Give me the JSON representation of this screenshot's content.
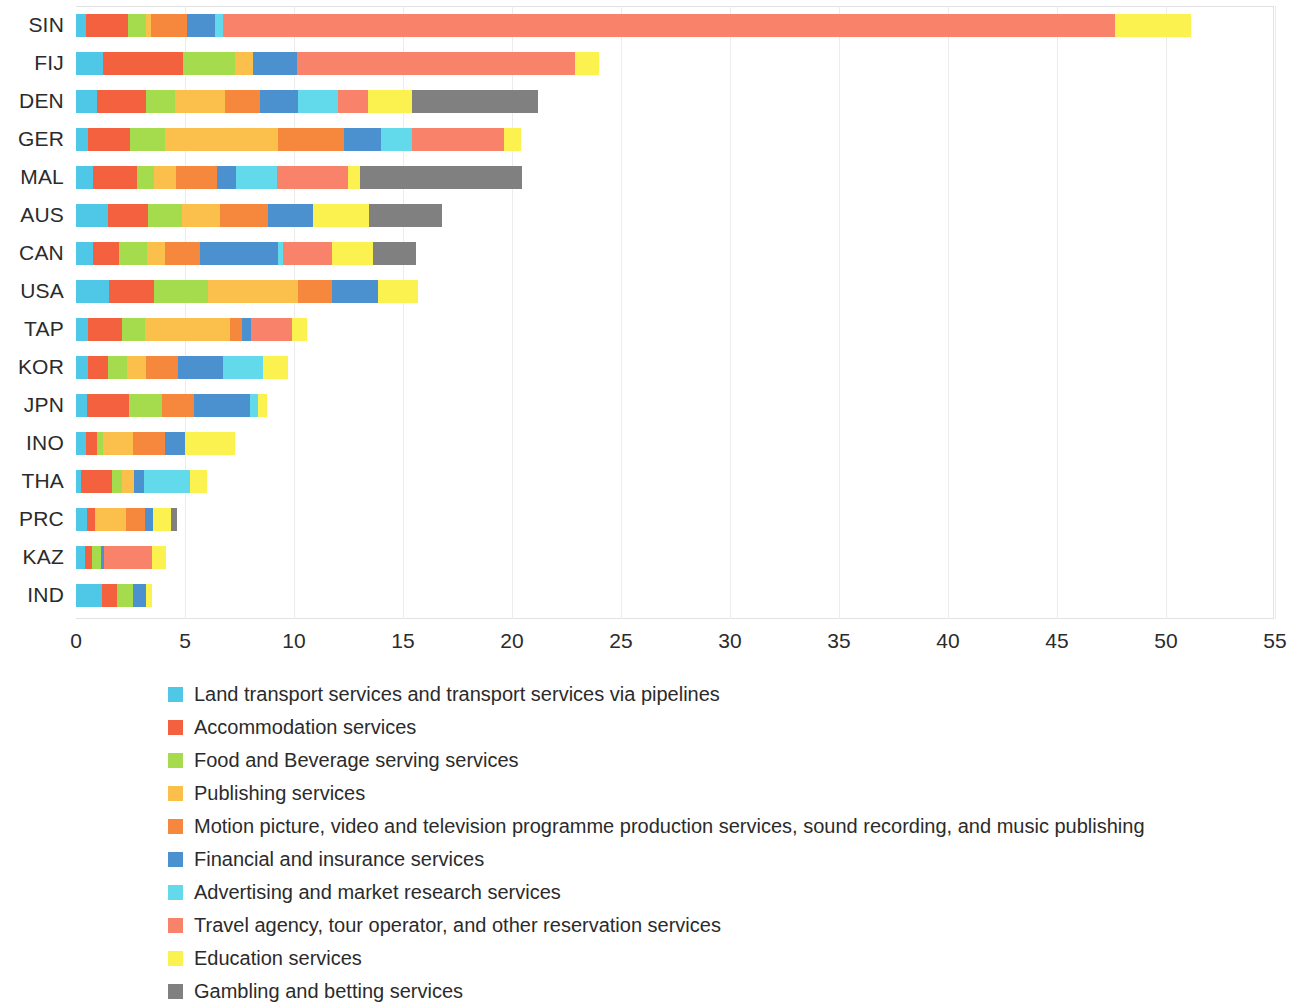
{
  "chart_data": {
    "type": "bar",
    "subtype": "horizontal-stacked",
    "title": "",
    "subtitle": "",
    "xlabel": "",
    "ylabel": "",
    "xlim": [
      0,
      55
    ],
    "ylim": null,
    "grid": true,
    "legend_position": "bottom-left",
    "x_ticks": [
      "0",
      "5",
      "10",
      "15",
      "20",
      "25",
      "30",
      "35",
      "40",
      "45",
      "50",
      "55"
    ],
    "x_tick_values": [
      0,
      5,
      10,
      15,
      20,
      25,
      30,
      35,
      40,
      45,
      50,
      55
    ],
    "categories": [
      "SIN",
      "FIJ",
      "DEN",
      "GER",
      "MAL",
      "AUS",
      "CAN",
      "USA",
      "TAP",
      "KOR",
      "JPN",
      "INO",
      "THA",
      "PRC",
      "KAZ",
      "IND"
    ],
    "series": [
      {
        "name": "Land transport services and transport services via pipelines",
        "color": "#4FC8E8",
        "values": [
          0.45,
          1.25,
          0.95,
          0.55,
          0.8,
          1.45,
          0.8,
          1.5,
          0.55,
          0.55,
          0.5,
          0.45,
          0.25,
          0.5,
          0.4,
          1.2
        ]
      },
      {
        "name": "Accommodation services",
        "color": "#F4613E",
        "values": [
          1.95,
          3.65,
          2.25,
          1.95,
          2.0,
          1.85,
          1.15,
          2.1,
          1.55,
          0.9,
          1.95,
          0.5,
          1.4,
          0.35,
          0.35,
          0.7
        ]
      },
      {
        "name": "Food and Beverage serving services",
        "color": "#A5DC4E",
        "values": [
          0.8,
          2.4,
          1.35,
          1.6,
          0.8,
          1.55,
          1.3,
          2.45,
          1.05,
          0.9,
          1.5,
          0.3,
          0.45,
          0.0,
          0.4,
          0.7
        ]
      },
      {
        "name": "Publishing services",
        "color": "#FBC04B",
        "values": [
          0.25,
          0.8,
          2.3,
          5.15,
          1.0,
          1.75,
          0.85,
          4.15,
          3.9,
          0.85,
          0.0,
          1.35,
          0.55,
          1.45,
          0.0,
          0.0
        ]
      },
      {
        "name": "Motion picture, video and television programme production services, sound recording, and music publishing",
        "color": "#F5883C",
        "values": [
          1.65,
          0.0,
          1.6,
          3.05,
          1.85,
          2.2,
          1.6,
          1.55,
          0.55,
          1.5,
          1.45,
          1.5,
          0.0,
          0.85,
          0.0,
          0.0
        ]
      },
      {
        "name": "Financial and insurance services",
        "color": "#4B91CF",
        "values": [
          1.3,
          2.05,
          1.75,
          1.7,
          0.9,
          2.05,
          3.55,
          2.1,
          0.45,
          2.05,
          2.6,
          0.9,
          0.45,
          0.4,
          0.15,
          0.6
        ]
      },
      {
        "name": "Advertising and market research services",
        "color": "#63D9EC",
        "values": [
          0.35,
          0.0,
          1.8,
          1.4,
          1.85,
          0.0,
          0.25,
          0.0,
          0.0,
          1.85,
          0.35,
          0.0,
          2.15,
          0.0,
          0.0,
          0.0
        ]
      },
      {
        "name": "Travel agency, tour operator, and other reservation services",
        "color": "#F8836A",
        "values": [
          40.9,
          12.75,
          1.4,
          4.25,
          3.3,
          0.0,
          2.25,
          0.0,
          1.85,
          0.0,
          0.0,
          0.0,
          0.0,
          0.0,
          2.2,
          0.0
        ]
      },
      {
        "name": "Education services",
        "color": "#FBF24F",
        "values": [
          3.5,
          1.1,
          2.0,
          0.75,
          0.55,
          2.6,
          1.9,
          1.85,
          0.7,
          1.15,
          0.4,
          2.3,
          0.75,
          0.8,
          0.65,
          0.3
        ]
      },
      {
        "name": "Gambling and betting services",
        "color": "#808080",
        "values": [
          0.0,
          0.0,
          5.8,
          0.0,
          7.4,
          3.35,
          1.95,
          0.0,
          0.0,
          0.0,
          0.0,
          0.0,
          0.0,
          0.3,
          0.0,
          0.0
        ]
      }
    ],
    "totals": [
      51.15,
      24.0,
      21.2,
      20.4,
      20.45,
      16.8,
      15.6,
      15.65,
      10.6,
      9.75,
      8.75,
      7.3,
      6.0,
      4.65,
      4.15,
      3.5
    ]
  }
}
